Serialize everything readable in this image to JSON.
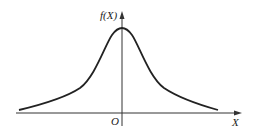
{
  "diagram": {
    "y_axis_label": "f(X)",
    "x_axis_label": "X",
    "origin_label": "O",
    "curve": "symmetric bell-shaped density curve centered at origin (heavy tails)"
  },
  "colors": {
    "stroke": "#222222",
    "background": "#ffffff"
  }
}
